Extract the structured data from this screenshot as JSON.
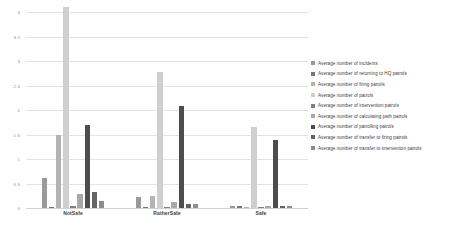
{
  "chart_data": {
    "type": "bar",
    "title": "",
    "xlabel": "",
    "ylabel": "",
    "ylim": [
      0,
      4
    ],
    "grid": true,
    "legend_position": "right",
    "categories": [
      "NotSafe",
      "RatherSafe",
      "Safe"
    ],
    "ytick_labels": [
      "4",
      "3.5",
      "3",
      "2.5",
      "2",
      "1.5",
      "1",
      "0.5",
      "0"
    ],
    "ytick_values": [
      4,
      3.5,
      3,
      2.5,
      2,
      1.5,
      1,
      0.5,
      0
    ],
    "series": [
      {
        "name": "Average number of incidents",
        "color": "#9a9a9a",
        "values": [
          0.62,
          0.22,
          0.05
        ]
      },
      {
        "name": "Average number of returning to HQ patrols",
        "color": "#767676",
        "values": [
          0.03,
          0.03,
          0.04
        ]
      },
      {
        "name": "Average number of firing patrols",
        "color": "#b3b3b3",
        "values": [
          1.5,
          0.24,
          0.01
        ]
      },
      {
        "name": "Average number of patrols",
        "color": "#cfcfcf",
        "values": [
          4.1,
          2.78,
          1.65
        ]
      },
      {
        "name": "Average number of intervention patrols",
        "color": "#808080",
        "values": [
          0.05,
          0.02,
          0.01
        ]
      },
      {
        "name": "Average number of calculating path patrols",
        "color": "#a8a8a8",
        "values": [
          0.28,
          0.12,
          0.05
        ]
      },
      {
        "name": "Average number of patrolling patrols",
        "color": "#4d4d4d",
        "values": [
          1.7,
          2.08,
          1.38
        ]
      },
      {
        "name": "Average number of transfer to firing patrols",
        "color": "#636363",
        "values": [
          0.32,
          0.08,
          0.04
        ]
      },
      {
        "name": "Average number of transfer to intervention patrols",
        "color": "#8c8c8c",
        "values": [
          0.14,
          0.09,
          0.04
        ]
      }
    ]
  }
}
